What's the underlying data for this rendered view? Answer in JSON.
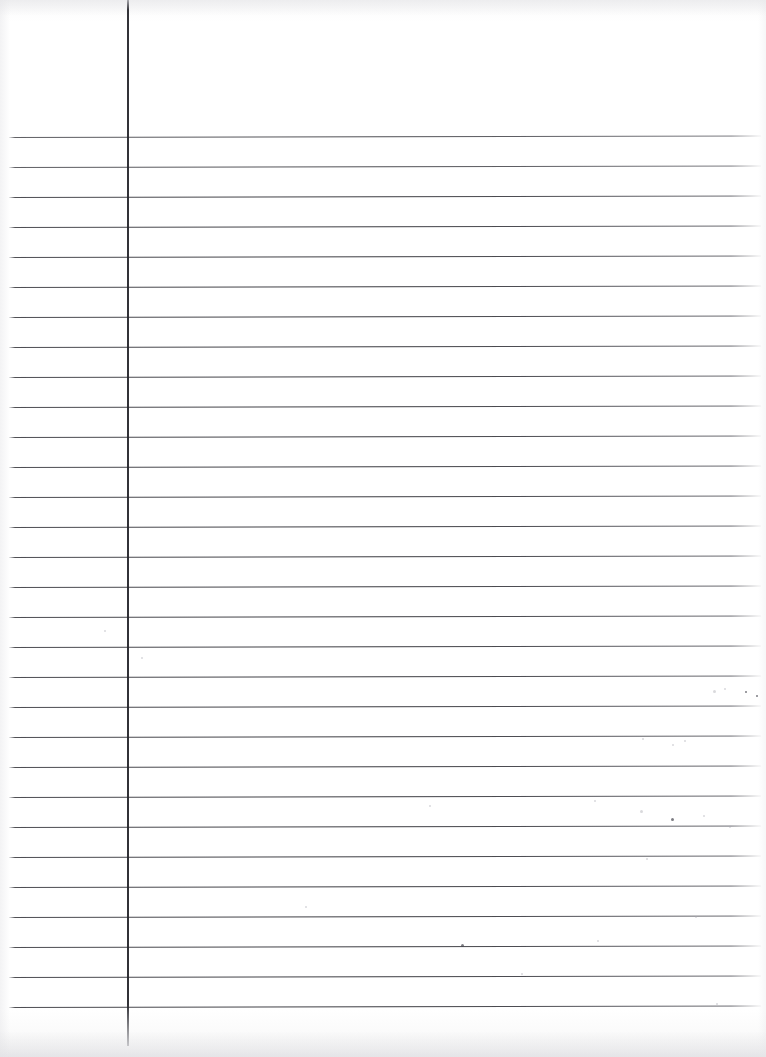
{
  "document": {
    "title": "Blank Ruled Notebook Page (scan)",
    "kind": "scanned-lined-paper",
    "page_width": 766,
    "page_height": 1057,
    "background_color": "#ffffff",
    "rule_color": "#303036",
    "margin_rule_color": "#28282e",
    "text_content": "",
    "line_count": 30,
    "line_spacing_px": 29.9,
    "first_line_y": 137,
    "rule_left_x": 9,
    "rule_right_x": 761,
    "margin_rule_x": 127,
    "margin_rule_top_y": 0,
    "margin_rule_bottom_y": 1046,
    "header_area_height_px": 137,
    "written_text_lines": [],
    "rule_y_positions": [
      137,
      167,
      197,
      227,
      257,
      287,
      317,
      347,
      377,
      407,
      437,
      467,
      497,
      527,
      557,
      587,
      617,
      647,
      677,
      707,
      737,
      767,
      797,
      827,
      857,
      887,
      917,
      947,
      977,
      1007
    ],
    "specks": [
      {
        "x": 713,
        "y": 690,
        "size": 3,
        "tone": "faint"
      },
      {
        "x": 724,
        "y": 688,
        "size": 2,
        "tone": "faint"
      },
      {
        "x": 745,
        "y": 691,
        "size": 2,
        "tone": "dark"
      },
      {
        "x": 756,
        "y": 695,
        "size": 2,
        "tone": "dark"
      },
      {
        "x": 684,
        "y": 740,
        "size": 2,
        "tone": "faint"
      },
      {
        "x": 672,
        "y": 744,
        "size": 2,
        "tone": "faint"
      },
      {
        "x": 642,
        "y": 738,
        "size": 2,
        "tone": "faint"
      },
      {
        "x": 640,
        "y": 810,
        "size": 3,
        "tone": "faint"
      },
      {
        "x": 671,
        "y": 818,
        "size": 3,
        "tone": "dark"
      },
      {
        "x": 703,
        "y": 815,
        "size": 2,
        "tone": "faint"
      },
      {
        "x": 729,
        "y": 826,
        "size": 2,
        "tone": "faint"
      },
      {
        "x": 594,
        "y": 800,
        "size": 2,
        "tone": "faint"
      },
      {
        "x": 429,
        "y": 805,
        "size": 2,
        "tone": "faint"
      },
      {
        "x": 646,
        "y": 858,
        "size": 2,
        "tone": "faint"
      },
      {
        "x": 461,
        "y": 944,
        "size": 3,
        "tone": "dark"
      },
      {
        "x": 597,
        "y": 940,
        "size": 2,
        "tone": "faint"
      },
      {
        "x": 695,
        "y": 916,
        "size": 2,
        "tone": "faint"
      },
      {
        "x": 104,
        "y": 630,
        "size": 2,
        "tone": "faint"
      },
      {
        "x": 141,
        "y": 657,
        "size": 2,
        "tone": "faint"
      },
      {
        "x": 521,
        "y": 973,
        "size": 2,
        "tone": "faint"
      },
      {
        "x": 716,
        "y": 1003,
        "size": 2,
        "tone": "faint"
      },
      {
        "x": 305,
        "y": 906,
        "size": 2,
        "tone": "faint"
      }
    ]
  }
}
